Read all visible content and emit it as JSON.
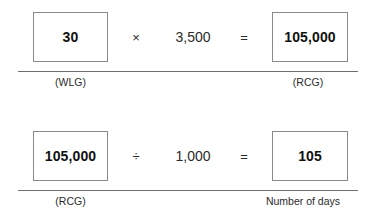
{
  "diagram": {
    "title": "",
    "background_color": "#ffffff",
    "box_border_color": "#8a8a8a",
    "rule_color": "#6f6f6f",
    "text_color": "#1a1a1a",
    "rows": [
      {
        "id": "row-1",
        "left_box_value": "30",
        "left_caption": "(WLG)",
        "operator_symbol": "×",
        "operator_name": "multiplication-sign",
        "operand_value": "3,500",
        "equals_symbol": "=",
        "right_box_value": "105,000",
        "right_caption": "(RCG)"
      },
      {
        "id": "row-2",
        "left_box_value": "105,000",
        "left_caption": "(RCG)",
        "operator_symbol": "÷",
        "operator_name": "division-sign",
        "operand_value": "1,000",
        "equals_symbol": "=",
        "right_box_value": "105",
        "right_caption": "Number of days"
      }
    ]
  }
}
